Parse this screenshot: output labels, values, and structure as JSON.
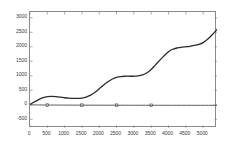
{
  "chart_data": {
    "type": "line",
    "title": "",
    "subtitle": "",
    "xlabel": "",
    "ylabel": "",
    "xlim": [
      0,
      5400
    ],
    "ylim": [
      -800,
      3200
    ],
    "grid": false,
    "legend": null,
    "background": "#ffffff",
    "axis_color": "#8a8a8a",
    "tick_label_color": "#3d3d3d",
    "x_ticks": [
      0,
      500,
      1000,
      1500,
      2000,
      2500,
      3000,
      3500,
      4000,
      4500,
      5000
    ],
    "x_tick_labels": [
      "0",
      "500",
      "1000",
      "1500",
      "2000",
      "2500",
      "3000",
      "3500",
      "4000",
      "4500",
      "5000"
    ],
    "y_ticks": [
      -500,
      0,
      500,
      1000,
      1500,
      2000,
      2500,
      3000
    ],
    "y_tick_labels": [
      "-500",
      "0",
      "500",
      "1000",
      "1500",
      "2000",
      "2500",
      "3000"
    ],
    "series": [
      {
        "name": "staircase-curve",
        "type": "line",
        "color": "#2b2b2b",
        "line_width": 1.3,
        "marker": "none",
        "x": [
          0,
          120,
          250,
          380,
          500,
          620,
          750,
          880,
          1000,
          1120,
          1250,
          1380,
          1500,
          1620,
          1750,
          1880,
          2000,
          2120,
          2250,
          2380,
          2500,
          2620,
          2750,
          2880,
          3000,
          3120,
          3250,
          3380,
          3500,
          3620,
          3750,
          3880,
          4000,
          4120,
          4250,
          4380,
          4500,
          4620,
          4750,
          4880,
          5000,
          5120,
          5250,
          5400
        ],
        "y": [
          10,
          95,
          180,
          245,
          280,
          290,
          280,
          262,
          243,
          228,
          220,
          220,
          232,
          268,
          335,
          432,
          552,
          678,
          795,
          890,
          948,
          975,
          985,
          985,
          985,
          995,
          1030,
          1105,
          1215,
          1370,
          1540,
          1700,
          1830,
          1915,
          1960,
          1985,
          2000,
          2018,
          2045,
          2085,
          2145,
          2250,
          2400,
          2600
        ]
      },
      {
        "name": "baseline-reference",
        "type": "line",
        "color": "#4a4a4a",
        "line_width": 0.9,
        "marker": "square",
        "marker_size": 2.6,
        "x": [
          0,
          500,
          1500,
          2500,
          3500,
          5400
        ],
        "y": [
          0,
          -8,
          -12,
          -14,
          -16,
          -18
        ],
        "marker_x": [
          500,
          1500,
          2500,
          3500
        ],
        "marker_y": [
          -8,
          -12,
          -14,
          -16
        ]
      }
    ]
  }
}
